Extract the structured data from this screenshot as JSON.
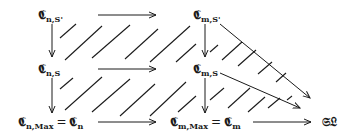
{
  "diagram": {
    "nodes": {
      "c_n_sprime": {
        "base": "𝕮",
        "sub": "n,S'"
      },
      "c_m_sprime": {
        "base": "𝕮",
        "sub": "m,S'"
      },
      "c_n_s": {
        "base": "𝕮",
        "sub": "n,S"
      },
      "c_m_s": {
        "base": "𝕮",
        "sub": "m,S"
      },
      "c_n_max": {
        "base": "𝕮",
        "sub": "n,Max",
        "eq": "=",
        "rhs_base": "𝕮",
        "rhs_sub": "n"
      },
      "c_m_max": {
        "base": "𝕮",
        "sub": "m,Max",
        "eq": "=",
        "rhs_base": "𝕮",
        "rhs_sub": "m"
      },
      "sl": {
        "label": "𝔖𝔏"
      }
    },
    "arrows": [
      {
        "from": "c_n_sprime",
        "to": "c_m_sprime",
        "direction": "horizontal"
      },
      {
        "from": "c_n_s",
        "to": "c_m_s",
        "direction": "horizontal"
      },
      {
        "from": "c_n_max",
        "to": "c_m_max",
        "direction": "horizontal"
      },
      {
        "from": "c_m_max",
        "to": "sl",
        "direction": "horizontal"
      },
      {
        "from": "c_n_sprime",
        "to": "c_n_s",
        "direction": "vertical"
      },
      {
        "from": "c_n_s",
        "to": "c_n_max",
        "direction": "vertical"
      },
      {
        "from": "c_m_sprime",
        "to": "c_m_s",
        "direction": "vertical"
      },
      {
        "from": "c_m_s",
        "to": "c_m_max",
        "direction": "vertical"
      },
      {
        "from": "c_m_sprime",
        "to": "sl",
        "direction": "diagonal"
      },
      {
        "from": "c_m_s",
        "to": "sl",
        "direction": "diagonal"
      }
    ],
    "hatching": "diagonal hatch marks indicating commuting regions"
  }
}
